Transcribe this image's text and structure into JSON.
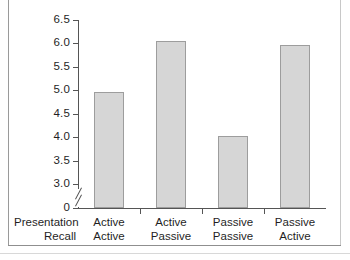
{
  "chart_data": {
    "type": "bar",
    "title": "",
    "subtitle": "",
    "xlabel": "",
    "ylabel": "",
    "categories": [
      "Active\nActive",
      "Active\nPassive",
      "Passive\nPassive",
      "Passive\nActive"
    ],
    "category_lines": [
      [
        "Active",
        "Active"
      ],
      [
        "Active",
        "Passive"
      ],
      [
        "Passive",
        "Passive"
      ],
      [
        "Passive",
        "Active"
      ]
    ],
    "values": [
      4.97,
      6.05,
      4.02,
      5.96
    ],
    "ylim": [
      3.0,
      6.5
    ],
    "y_axis_broken": true,
    "y_break_between": [
      0,
      3.0
    ],
    "yticks": [
      {
        "label": "6.5",
        "value": 6.5
      },
      {
        "label": "6.0",
        "value": 6.0
      },
      {
        "label": "5.5",
        "value": 5.5
      },
      {
        "label": "5.0",
        "value": 5.0
      },
      {
        "label": "4.5",
        "value": 4.5
      },
      {
        "label": "4.0",
        "value": 4.0
      },
      {
        "label": "3.5",
        "value": 3.5
      },
      {
        "label": "3.0",
        "value": 3.0
      },
      {
        "label": "0",
        "value": 0
      }
    ],
    "grid": false,
    "legend": null,
    "legend_position": "none",
    "bar_color": "#d6d6d6",
    "bar_edge_color": "#9d9d9d",
    "axis_color": "#555555"
  },
  "axis_header": {
    "line1": "Presentation",
    "line2": "Recall"
  }
}
